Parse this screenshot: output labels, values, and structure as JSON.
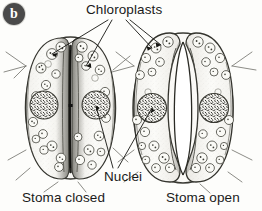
{
  "figure": {
    "panel_label": "b",
    "background_color": "#fdfdfb",
    "ink_color": "#2b2b2b"
  },
  "labels": {
    "chloroplasts": "Chloroplasts",
    "nuclei": "Nuclei"
  },
  "captions": {
    "closed": "Stoma closed",
    "open": "Stoma open"
  },
  "diagram_content": {
    "type": "biological-illustration",
    "subject": "Stomata guard cells",
    "style": "pen-and-ink stipple line drawing, grayscale",
    "panels": [
      {
        "name": "stoma-closed",
        "caption": "Stoma closed",
        "description": "Two elliptical guard cells pressed together; the pore between them is reduced to a narrow dark slit.",
        "guard_cells": 2,
        "pore_state": "closed",
        "pore_width_px": 3,
        "nuclei": 2,
        "chloroplasts_visible": 26
      },
      {
        "name": "stoma-open",
        "caption": "Stoma open",
        "description": "Two crescent-shaped guard cells bowed apart; a wide lens-shaped pore opens between them.",
        "guard_cells": 2,
        "pore_state": "open",
        "pore_width_px": 17,
        "nuclei": 2,
        "chloroplasts_visible": 30
      }
    ],
    "annotations": [
      {
        "label": "Chloroplasts",
        "leader_count": 4,
        "points_to": "small granular organelles in the cytoplasm of both the closed and open guard cells"
      },
      {
        "label": "Nuclei",
        "leader_count": 2,
        "points_to": "large speckled round nuclei, one in a closed-stoma guard cell and one in an open-stoma guard cell"
      }
    ]
  }
}
